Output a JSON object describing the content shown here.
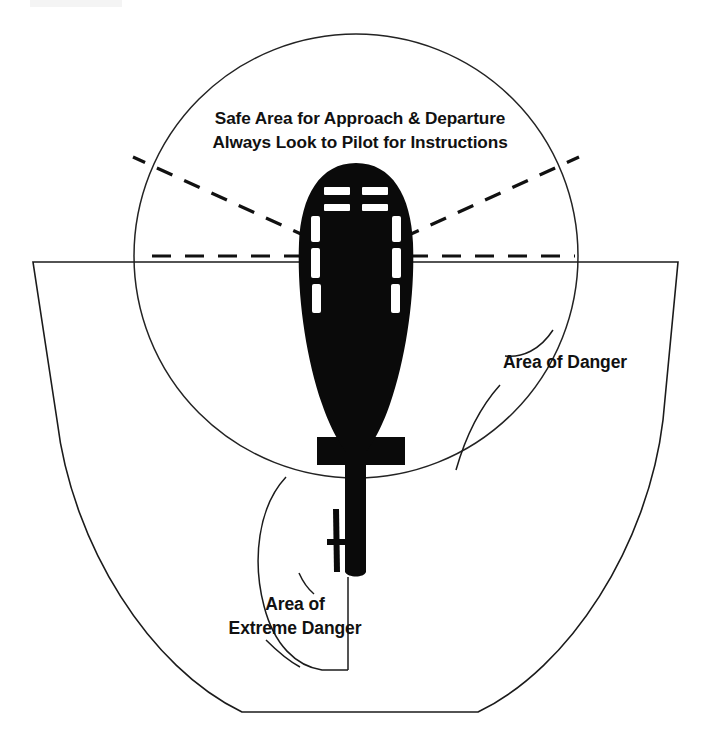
{
  "diagram": {
    "canvas": {
      "width": 704,
      "height": 743,
      "background": "#ffffff"
    },
    "labels": {
      "safe_area_line1": "Safe Area for Approach & Departure",
      "safe_area_line2": "Always Look to Pilot for Instructions",
      "area_of_danger": "Area of Danger",
      "extreme_danger_line1": "Area of",
      "extreme_danger_line2": "Extreme Danger"
    },
    "colors": {
      "ink": "#111111",
      "outline": "#1b1b1b",
      "aircraft": "#0a0a0a",
      "window": "#ffffff",
      "background": "#ffffff"
    },
    "zones": [
      {
        "name": "safe-area-circle",
        "label": "Safe Area for Approach & Departure",
        "shape": "circle",
        "center_x": 356,
        "center_y": 256,
        "radius": 222
      },
      {
        "name": "area-of-danger-bucket",
        "label": "Area of Danger",
        "shape": "bucket",
        "top_y": 262,
        "left_x": 33,
        "right_x": 678,
        "bottom_y": 713,
        "bottom_left_x": 242,
        "bottom_right_x": 478
      },
      {
        "name": "area-of-extreme-danger",
        "label": "Area of Extreme Danger",
        "shape": "tail-rotor-arc",
        "note": "Region surrounding the tail rotor"
      }
    ],
    "aircraft": {
      "name": "helicopter-silhouette",
      "orientation": "nose-up",
      "nose_y": 163,
      "tail_y": 573,
      "center_x": 356,
      "rotor_hub_x": 356,
      "rotor_hub_y": 257,
      "stabilizer_y": 451,
      "tail_rotor_side": "left"
    },
    "rotor_disc": {
      "name": "main-rotor-blades",
      "style": "dashed",
      "blade_count": 4,
      "hub_x": 356,
      "hub_y": 257
    }
  }
}
